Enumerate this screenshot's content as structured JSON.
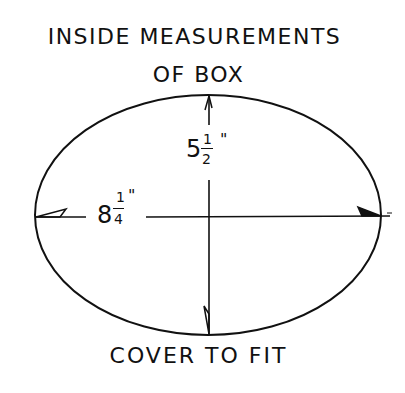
{
  "diagram": {
    "title_line1": "INSIDE MEASUREMENTS",
    "title_line2": "OF BOX",
    "caption": "COVER TO FIT",
    "shape": "ellipse",
    "width_dimension": {
      "whole": "8",
      "numerator": "1",
      "denominator": "4",
      "unit": "\""
    },
    "height_dimension": {
      "whole": "5",
      "numerator": "1",
      "denominator": "2",
      "unit": "\""
    },
    "line_color": "#111111",
    "background_color": "#ffffff"
  }
}
